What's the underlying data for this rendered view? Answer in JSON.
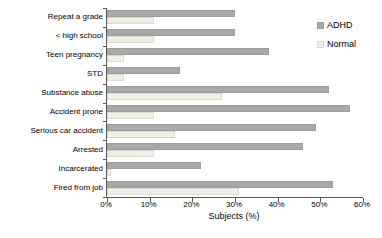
{
  "chart_data": {
    "type": "bar",
    "orientation": "horizontal",
    "categories": [
      "Repeat a grade",
      "< high school",
      "Teen pregnancy",
      "STD",
      "Substance abuse",
      "Accident prone",
      "Serious car accident",
      "Arrested",
      "Incarcerated",
      "Fired from job"
    ],
    "series": [
      {
        "name": "ADHD",
        "color": "#a9a9a9",
        "border_color": "#9c9c9c",
        "values": [
          30,
          30,
          38,
          17,
          52,
          57,
          49,
          46,
          22,
          53
        ]
      },
      {
        "name": "Normal",
        "color": "#f0efe6",
        "border_color": "#dbdad0",
        "values": [
          11,
          11,
          4,
          4,
          27,
          11,
          16,
          11,
          1,
          31
        ]
      }
    ],
    "xlabel": "Subjects (%)",
    "xlim": [
      0,
      60
    ],
    "xtick_values": [
      0,
      10,
      20,
      30,
      40,
      50,
      60
    ],
    "xtick_labels": [
      "0%",
      "10%",
      "20%",
      "30%",
      "40%",
      "50%",
      "60%"
    ],
    "legend_position": "top-right",
    "grid": false,
    "axis_color": "#5a5a5a"
  }
}
